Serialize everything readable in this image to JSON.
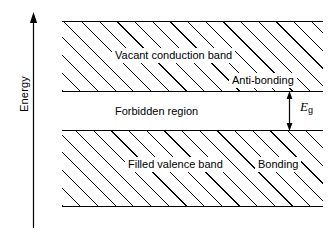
{
  "figure": {
    "type": "energy-band-diagram",
    "background_color": "#ffffff",
    "line_color": "#000000"
  },
  "axis": {
    "label": "Energy",
    "direction": "up",
    "arrow_icon": "up-arrow-icon"
  },
  "bands": {
    "conduction": {
      "label": "Vacant conduction band",
      "edge_label": "Anti-bonding",
      "fill": "hatched"
    },
    "gap": {
      "label": "Forbidden region",
      "fill": "none"
    },
    "valence": {
      "label": "Filled valence band",
      "edge_label": "Bonding",
      "fill": "hatched"
    }
  },
  "gap_marker": {
    "symbol": "E",
    "subscript": "g",
    "arrow_icon": "double-headed-vertical-arrow-icon"
  }
}
